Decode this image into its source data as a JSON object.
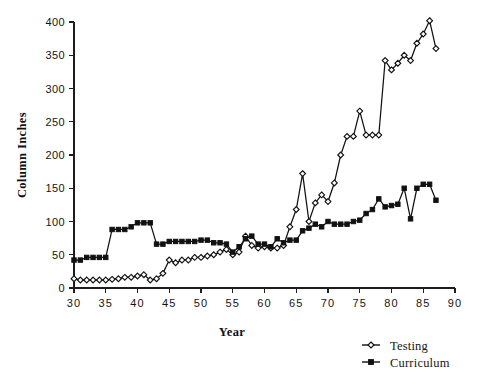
{
  "chart_data": {
    "type": "line",
    "title": "",
    "subtitle": "",
    "xlabel": "Year",
    "ylabel": "Column Inches",
    "xlim": [
      30,
      90
    ],
    "ylim": [
      0,
      400
    ],
    "xticks": [
      30,
      35,
      40,
      45,
      50,
      55,
      60,
      65,
      70,
      75,
      80,
      85,
      90
    ],
    "yticks": [
      0,
      50,
      100,
      150,
      200,
      250,
      300,
      350,
      400
    ],
    "xtick_labels": [
      "30",
      "35",
      "40",
      "45",
      "50",
      "55",
      "60",
      "65",
      "70",
      "75",
      "80",
      "85",
      "90"
    ],
    "ytick_labels": [
      "0",
      "50",
      "100",
      "150",
      "200",
      "250",
      "300",
      "350",
      "400"
    ],
    "grid": false,
    "legend_position": "bottom-right",
    "x": [
      30,
      31,
      32,
      33,
      34,
      35,
      36,
      37,
      38,
      39,
      40,
      41,
      42,
      43,
      44,
      45,
      46,
      47,
      48,
      49,
      50,
      51,
      52,
      53,
      54,
      55,
      56,
      57,
      58,
      59,
      60,
      61,
      62,
      63,
      64,
      65,
      66,
      67,
      68,
      69,
      70,
      71,
      72,
      73,
      74,
      75,
      76,
      77,
      78,
      79,
      80,
      81,
      82,
      83,
      84,
      85,
      86,
      87
    ],
    "series": [
      {
        "name": "Testing",
        "marker": "open-diamond",
        "values": [
          14,
          12,
          12,
          12,
          12,
          12,
          13,
          14,
          16,
          16,
          18,
          20,
          12,
          14,
          22,
          42,
          38,
          42,
          42,
          46,
          46,
          48,
          50,
          54,
          58,
          50,
          54,
          78,
          64,
          60,
          62,
          60,
          60,
          64,
          92,
          118,
          172,
          100,
          128,
          140,
          130,
          158,
          200,
          228,
          228,
          266,
          230,
          230,
          230,
          342,
          328,
          338,
          350,
          342,
          368,
          382,
          402,
          360
        ]
      },
      {
        "name": "Curriculum",
        "marker": "filled-square",
        "values": [
          42,
          42,
          46,
          46,
          46,
          46,
          88,
          88,
          88,
          92,
          98,
          98,
          98,
          66,
          66,
          70,
          70,
          70,
          70,
          70,
          72,
          72,
          68,
          68,
          66,
          54,
          62,
          74,
          78,
          66,
          66,
          62,
          74,
          68,
          72,
          72,
          86,
          90,
          96,
          92,
          100,
          96,
          96,
          96,
          100,
          102,
          112,
          118,
          134,
          122,
          124,
          126,
          150,
          104,
          150,
          156,
          156,
          132
        ]
      }
    ]
  },
  "legend": {
    "entries": [
      {
        "label": "Testing",
        "marker": "open-diamond"
      },
      {
        "label": "Curriculum",
        "marker": "filled-square"
      }
    ]
  },
  "axes": {
    "x_title": "Year",
    "y_title": "Column Inches"
  },
  "colors": {
    "ink": "#111111",
    "background": "#ffffff"
  }
}
